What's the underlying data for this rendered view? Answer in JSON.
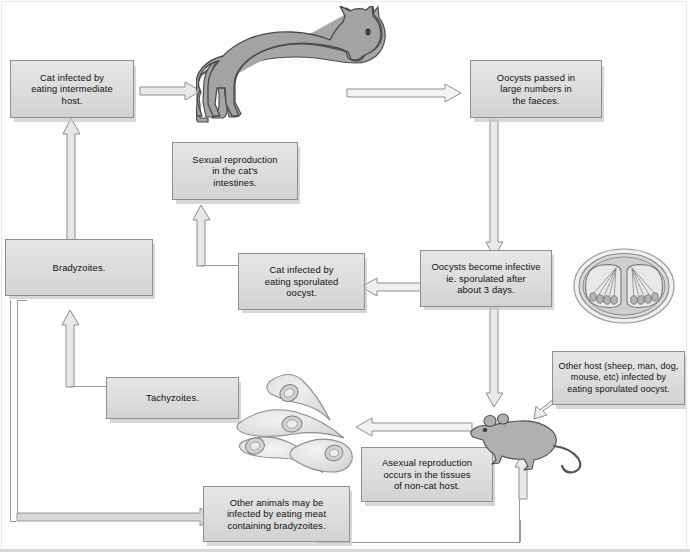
{
  "diagram": {
    "boxes": {
      "cat_infected_intermediate": "Cat infected by eating intermediate host.",
      "oocysts_passed": "Oocysts passed in large numbers in the faeces.",
      "sexual_reproduction": "Sexual reproduction in the cat's intestines.",
      "bradyzoites": "Bradyzoites.",
      "cat_infected_oocyst": "Cat infected by eating sporulated oocyst.",
      "oocysts_infective": "Oocysts become infective ie. sporulated after about 3 days.",
      "other_host": "Other host (sheep, man, dog, mouse, etc) infected by eating sporulated oocyst.",
      "tachyzoites": "Tachyzoites.",
      "asexual_reproduction": "Asexual reproduction occurs in the tissues of non-cat host.",
      "other_animals": "Other animals may be infected by eating meat containing bradyzoites."
    },
    "box_lines": {
      "cat_infected_intermediate": [
        "Cat infected by",
        "eating intermediate",
        "host."
      ],
      "oocysts_passed": [
        "Oocysts passed in",
        "large numbers in",
        "the faeces."
      ],
      "sexual_reproduction": [
        "Sexual reproduction",
        "in the cat's",
        "intestines."
      ],
      "bradyzoites": [
        "Bradyzoites."
      ],
      "cat_infected_oocyst": [
        "Cat infected by",
        "eating sporulated",
        "oocyst."
      ],
      "oocysts_infective": [
        "Oocysts become infective",
        "ie. sporulated after",
        "about 3 days."
      ],
      "other_host": [
        "Other host (sheep, man, dog,",
        "mouse, etc) infected by",
        "eating sporulated oocyst."
      ],
      "tachyzoites": [
        "Tachyzoites."
      ],
      "asexual_reproduction": [
        "Asexual reproduction",
        "occurs in the tissues",
        "of non-cat host."
      ],
      "other_animals": [
        "Other animals may be",
        "infected by eating meat",
        "containing bradyzoites."
      ]
    },
    "figures": {
      "cat": "cat-illustration",
      "oocyst": "sporulated-oocyst-illustration",
      "tachyzoites": "tachyzoites-illustration",
      "mouse": "mouse-illustration"
    },
    "colors": {
      "box_fill": "#dcdcdc",
      "box_border": "#8f8f8f",
      "line": "#9a9a9a",
      "arrow_fill": "#e8e8e8",
      "arrow_stroke": "#8c8c8c",
      "animal_fill": "#a8a8a8",
      "animal_stroke": "#4a4a4a",
      "background": "#fdfdfd"
    }
  }
}
